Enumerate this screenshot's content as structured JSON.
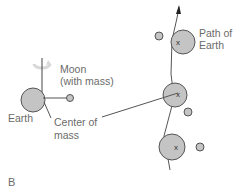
{
  "panel_label": "B",
  "labels": {
    "moon": "Moon",
    "moon_sub": "(with mass)",
    "earth": "Earth",
    "center_of_mass": "Center of",
    "center_of_mass_sub": "mass",
    "path_of_earth": "Path of",
    "path_of_earth_sub": "Earth"
  },
  "markers": {
    "cross": "x"
  },
  "colors": {
    "body_fill": "#c4c4c4",
    "stroke": "#555555",
    "text": "#6b6b6b"
  }
}
